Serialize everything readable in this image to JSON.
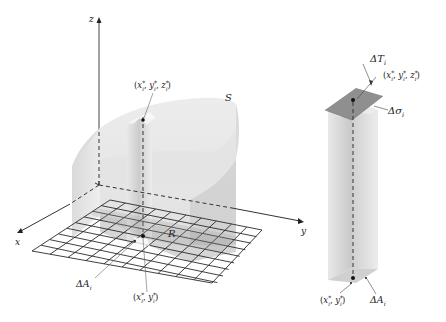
{
  "figure": {
    "left": {
      "axes": {
        "x": "x",
        "y": "y",
        "z": "z"
      },
      "surface_label": "S",
      "region_label": "R",
      "area_element_label": "ΔA",
      "area_element_sub": "i",
      "top_point_label": "(x*, y*, z*)",
      "top_point": {
        "x": "x",
        "y": "y",
        "z": "z",
        "sub": "i",
        "sup": "*"
      },
      "bottom_point_label": "(x*, y*)",
      "bottom_point": {
        "x": "x",
        "y": "y",
        "sub": "i",
        "sup": "*"
      }
    },
    "right": {
      "tangent_label": "ΔT",
      "tangent_sub": "i",
      "surface_element_label": "Δσ",
      "surface_element_sub": "i",
      "area_element_label": "ΔA",
      "area_element_sub": "i",
      "top_point": {
        "x": "x",
        "y": "y",
        "z": "z",
        "sub": "i",
        "sup": "*"
      },
      "bottom_point": {
        "x": "x",
        "y": "y",
        "sub": "i",
        "sup": "*"
      }
    },
    "colors": {
      "solid_light": "#e6e6e6",
      "solid_mid": "#cfcfcf",
      "solid_dark": "#b8b8b8",
      "tangent_plane": "#8a8a8a",
      "grid_line": "#333333",
      "axis": "#333333"
    }
  }
}
